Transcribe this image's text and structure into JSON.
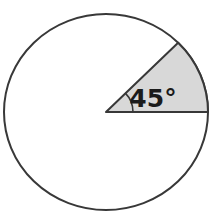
{
  "figure": {
    "angle_label": "45°",
    "angle_degrees": 45,
    "sector_start_degrees": 0,
    "sector_end_degrees": 45,
    "colors": {
      "background": "#ffffff",
      "circle_fill": "#ffffff",
      "sector_fill": "#d8d8d8",
      "outline": "#383838",
      "label_color": "#1b1b1b"
    }
  }
}
